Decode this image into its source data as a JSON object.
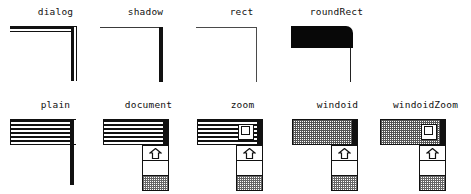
{
  "figure": {
    "rows": [
      {
        "row_name": "frames-without-titlebar",
        "items": [
          {
            "label": "dialog",
            "style": "dialog",
            "description": "Heavy outer rule with hairline inner rule forming a double border corner",
            "titlebar": "none",
            "scrollbar": false,
            "zoombox": false,
            "top_rule": "thick",
            "right_rule": "thick+hairline"
          },
          {
            "label": "shadow",
            "style": "shadow",
            "description": "Hairline top rule with heavy right rule simulating a drop shadow",
            "titlebar": "none",
            "scrollbar": false,
            "zoombox": false,
            "top_rule": "hairline",
            "right_rule": "thick"
          },
          {
            "label": "rect",
            "style": "rect",
            "description": "Plain hairline rectangle corner",
            "titlebar": "none",
            "scrollbar": false,
            "zoombox": false,
            "top_rule": "hairline",
            "right_rule": "hairline"
          },
          {
            "label": "roundRect",
            "style": "roundRect",
            "description": "Solid black slab with a rounded top-right corner",
            "titlebar": "none",
            "scrollbar": false,
            "zoombox": false,
            "top_rule": "solid-fill",
            "right_rule": "hairline"
          }
        ]
      },
      {
        "row_name": "frames-with-titlebar",
        "items": [
          {
            "label": "plain",
            "style": "plain",
            "description": "Striped title bar with a heavy right edge, no scroll bar",
            "titlebar": "striped",
            "scrollbar": false,
            "zoombox": false,
            "top_rule": "hairline",
            "right_rule": "thick"
          },
          {
            "label": "document",
            "style": "document",
            "description": "Striped title bar with a vertical scroll bar",
            "titlebar": "striped",
            "scrollbar": true,
            "zoombox": false,
            "top_rule": "hairline",
            "right_rule": "thick"
          },
          {
            "label": "zoom",
            "style": "zoom",
            "description": "Striped title bar with a zoom box and a vertical scroll bar",
            "titlebar": "striped",
            "scrollbar": true,
            "zoombox": true,
            "top_rule": "hairline",
            "right_rule": "thick"
          },
          {
            "label": "windoid",
            "style": "windoid",
            "description": "Dotted gray title bar with a vertical scroll bar",
            "titlebar": "dotted",
            "scrollbar": true,
            "zoombox": false,
            "top_rule": "hairline",
            "right_rule": "thick"
          },
          {
            "label": "windoidZoom",
            "style": "windoidZoom",
            "description": "Dotted gray title bar with a zoom box and a vertical scroll bar",
            "titlebar": "dotted",
            "scrollbar": true,
            "zoombox": true,
            "top_rule": "hairline",
            "right_rule": "thick"
          }
        ]
      }
    ],
    "icons": {
      "scroll_up_arrow": "scroll-up-arrow-icon",
      "zoom_box": "zoom-box-icon"
    },
    "colors": {
      "ink": "#111111",
      "paper": "#ffffff",
      "gray_pattern": "#666666"
    }
  }
}
